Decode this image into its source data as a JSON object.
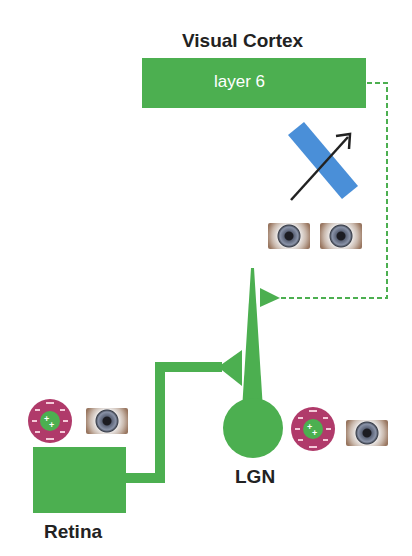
{
  "title": "Visual Cortex",
  "cortex_layer_label": "layer 6",
  "lgn_label": "LGN",
  "retina_label": "Retina",
  "receptive_field": {
    "center_sign": "+",
    "surround_sign": "-"
  },
  "icons": [
    "eye-icon",
    "orientation-bar-icon",
    "direction-arrow-icon",
    "center-surround-receptive-field-icon"
  ],
  "colors": {
    "green": "#4caf50",
    "blue": "#4a8fd8",
    "magenta": "#b03a6a",
    "text": "#222222"
  }
}
